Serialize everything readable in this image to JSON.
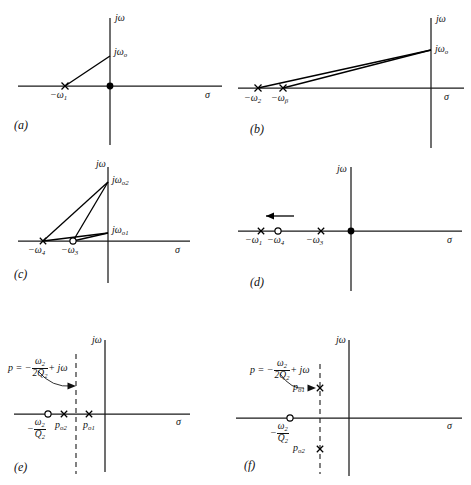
{
  "figure": {
    "type": "pole-zero-plot-grid",
    "axis_labels": {
      "real": "σ",
      "imag": "jω"
    },
    "marker_legend": {
      "pole": "×",
      "zero": "○",
      "point": "●"
    }
  },
  "panels": [
    {
      "key": "a",
      "letter": "(a)",
      "labels": {
        "imag_axis": "jω",
        "real_axis": "σ",
        "pole": "−ω",
        "pole_sub": "1",
        "point": "jω",
        "point_sub": "o"
      },
      "markers": [
        {
          "name": "pole-omega1",
          "type": "pole",
          "x": -1.0,
          "y": 0.0
        },
        {
          "name": "origin-point",
          "type": "point",
          "x": 0.0,
          "y": 0.0
        },
        {
          "name": "j-omega-o",
          "type": "none",
          "x": 0.0,
          "y": 1.0
        }
      ],
      "rays": [
        {
          "from": "pole-omega1",
          "to": "j-omega-o"
        }
      ]
    },
    {
      "key": "b",
      "letter": "(b)",
      "labels": {
        "imag_axis": "jω",
        "real_axis": "σ",
        "pole1": "−ω",
        "pole1_sub": "2",
        "pole2": "−ω",
        "pole2_sub": "β",
        "point": "jω",
        "point_sub": "o"
      },
      "markers": [
        {
          "name": "pole-omega2",
          "type": "pole",
          "x": -1.0,
          "y": 0.0
        },
        {
          "name": "pole-omega-beta",
          "type": "pole",
          "x": -0.86,
          "y": 0.0
        },
        {
          "name": "j-omega-o",
          "type": "none",
          "x": 0.0,
          "y": 0.55
        }
      ],
      "rays": [
        {
          "from": "pole-omega2",
          "to": "j-omega-o"
        },
        {
          "from": "pole-omega-beta",
          "to": "j-omega-o"
        }
      ]
    },
    {
      "key": "c",
      "letter": "(c)",
      "labels": {
        "imag_axis": "jω",
        "real_axis": "σ",
        "pole": "−ω",
        "pole_sub": "4",
        "zero": "−ω",
        "zero_sub": "3",
        "point2": "jω",
        "point2_sub": "o2",
        "point1": "jω",
        "point1_sub": "o1"
      },
      "markers": [
        {
          "name": "pole-omega4",
          "type": "pole",
          "x": -1.0,
          "y": 0.0
        },
        {
          "name": "zero-omega3",
          "type": "zero",
          "x": -0.62,
          "y": 0.0
        },
        {
          "name": "j-omega-o2",
          "type": "none",
          "x": 0.0,
          "y": 1.0
        },
        {
          "name": "j-omega-o1",
          "type": "none",
          "x": 0.0,
          "y": 0.12
        }
      ],
      "rays": [
        {
          "from": "pole-omega4",
          "to": "j-omega-o2"
        },
        {
          "from": "pole-omega4",
          "to": "j-omega-o1"
        },
        {
          "from": "zero-omega3",
          "to": "j-omega-o2"
        },
        {
          "from": "zero-omega3",
          "to": "j-omega-o1"
        }
      ]
    },
    {
      "key": "d",
      "letter": "(d)",
      "labels": {
        "imag_axis": "jω",
        "real_axis": "σ",
        "pole1": "−ω",
        "pole1_sub": "1",
        "zero": "−ω",
        "zero_sub": "4",
        "pole2": "−ω",
        "pole2_sub": "3"
      },
      "markers": [
        {
          "name": "pole-omega1",
          "type": "pole",
          "x": -1.0,
          "y": 0.0
        },
        {
          "name": "zero-omega4",
          "type": "zero",
          "x": -0.82,
          "y": 0.0
        },
        {
          "name": "pole-omega3",
          "type": "pole",
          "x": -0.44,
          "y": 0.0
        },
        {
          "name": "origin-point",
          "type": "point",
          "x": 0.0,
          "y": 0.0
        }
      ],
      "arrow": {
        "name": "motion-arrow",
        "direction": "left"
      }
    },
    {
      "key": "e",
      "letter": "(e)",
      "labels": {
        "imag_axis": "jω",
        "real_axis": "σ",
        "equation_lhs": "p",
        "equation_eq": "=",
        "equation_minus": "−",
        "equation_num": "ω",
        "equation_num_sub": "2",
        "equation_den": "2Q",
        "equation_den_sub": "2",
        "equation_tail": "+ jω",
        "zero": "−",
        "zero_num": "ω",
        "zero_num_sub": "2",
        "zero_den": "Q",
        "zero_den_sub": "2",
        "pole2": "p",
        "pole2_sub": "o2",
        "pole1": "p",
        "pole1_sub": "o1"
      },
      "markers": [
        {
          "name": "zero-omega2-over-Q2",
          "type": "zero",
          "x": -0.7,
          "y": 0.0
        },
        {
          "name": "pole-po2",
          "type": "pole",
          "x": -0.47,
          "y": 0.0
        },
        {
          "name": "pole-po1",
          "type": "pole",
          "x": -0.16,
          "y": 0.0
        }
      ],
      "dashed_line": {
        "name": "sigma-constant-line",
        "x": -0.33
      }
    },
    {
      "key": "f",
      "letter": "(f)",
      "labels": {
        "imag_axis": "jω",
        "real_axis": "σ",
        "equation_lhs": "p",
        "equation_eq": "=",
        "equation_minus": "−",
        "equation_num": "ω",
        "equation_num_sub": "2",
        "equation_den": "2Q",
        "equation_den_sub": "2",
        "equation_tail": "+ jω",
        "zero": "−",
        "zero_num": "ω",
        "zero_num_sub": "2",
        "zero_den": "Q",
        "zero_den_sub": "2",
        "pole1": "p",
        "pole1_sub": "o1",
        "pole2": "p",
        "pole2_sub": "o2"
      },
      "markers": [
        {
          "name": "zero-omega2-over-Q2",
          "type": "zero",
          "x": -0.6,
          "y": 0.0
        },
        {
          "name": "pole-po1",
          "type": "pole",
          "x": -0.33,
          "y": 0.62
        },
        {
          "name": "pole-po2",
          "type": "pole",
          "x": -0.33,
          "y": -0.72
        }
      ],
      "dashed_line": {
        "name": "sigma-constant-line",
        "x": -0.33
      }
    }
  ]
}
